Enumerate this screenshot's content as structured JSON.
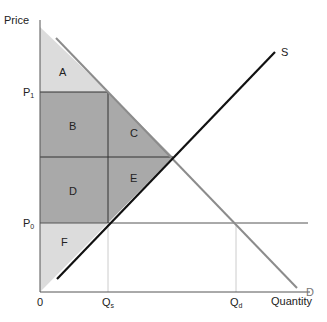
{
  "axes": {
    "y_label": "Price",
    "x_label": "Quantity",
    "origin": "0"
  },
  "ticks": {
    "p1": {
      "main": "P",
      "sub": "1"
    },
    "p0": {
      "main": "P",
      "sub": "0"
    },
    "qs": {
      "main": "Q",
      "sub": "s"
    },
    "qd": {
      "main": "Q",
      "sub": "d"
    }
  },
  "curves": {
    "supply": "S",
    "demand": "D"
  },
  "regions": {
    "a": "A",
    "b": "B",
    "c": "C",
    "d": "D",
    "e": "E",
    "f": "F"
  },
  "colors": {
    "light_fill": "#dcdcdc",
    "dark_fill": "#a9a9a9",
    "demand_line": "#8c8c8c",
    "supply_line": "#111111"
  }
}
